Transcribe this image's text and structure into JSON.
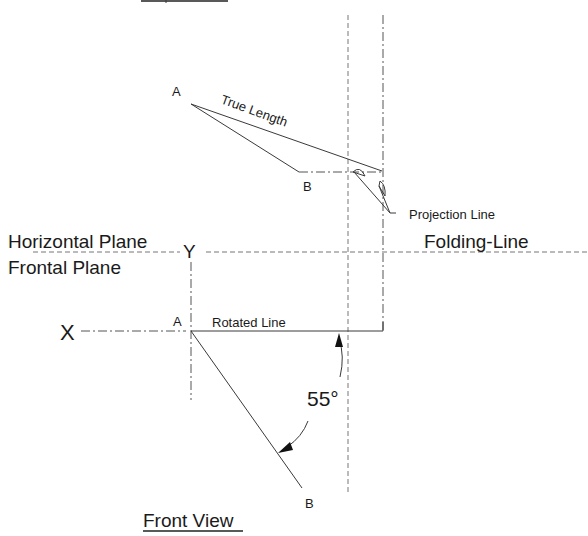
{
  "diagram": {
    "top_view": {
      "cropped_title_underline": true,
      "point_a_label": "A",
      "point_b_label": "B",
      "true_length_label": "True Length",
      "projection_line_label": "Projection Line"
    },
    "planes": {
      "horizontal_plane_label": "Horizontal Plane",
      "frontal_plane_label": "Frontal Plane",
      "folding_line_label": "Folding-Line",
      "y_label": "Y",
      "x_label": "X"
    },
    "front_view": {
      "title": "Front View",
      "point_a_label": "A",
      "point_b_label": "B",
      "rotated_line_label": "Rotated Line",
      "angle_label": "55°"
    },
    "colors": {
      "background": "#ffffff",
      "ink": "#1a1a1a",
      "line": "#3a3a3a"
    }
  }
}
